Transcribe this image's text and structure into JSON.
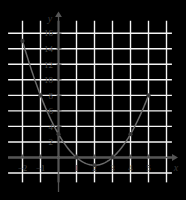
{
  "chart_data": {
    "type": "scatter",
    "title": "",
    "xlabel": "x",
    "ylabel": "y",
    "x": [
      -2,
      -1,
      0,
      1,
      2,
      3,
      4,
      5
    ],
    "values": [
      15,
      8,
      3,
      0,
      -1,
      0,
      3,
      8
    ],
    "series": [
      {
        "name": "y = x^2 - 4x + 3",
        "points": [
          {
            "x": -2,
            "y": 15
          },
          {
            "x": -1,
            "y": 8
          },
          {
            "x": 0,
            "y": 3
          },
          {
            "x": 1,
            "y": 0
          },
          {
            "x": 2,
            "y": -1
          },
          {
            "x": 3,
            "y": 0
          },
          {
            "x": 4,
            "y": 3
          },
          {
            "x": 5,
            "y": 8
          }
        ]
      }
    ],
    "xlim": [
      -2.8,
      6.3
    ],
    "ylim": [
      -3.2,
      17.6
    ],
    "xticks": [
      -2,
      -1,
      1,
      2,
      3,
      4,
      5
    ],
    "xtick_labels": [
      "−2",
      "−1",
      "1",
      "2",
      "3",
      "4",
      "5"
    ],
    "yticks": [
      2,
      4,
      6,
      8,
      10,
      12,
      14,
      16
    ],
    "ytick_labels": [
      "2",
      "4",
      "6",
      "8",
      "10",
      "12",
      "14",
      "16"
    ],
    "grid": true,
    "legend": "none",
    "curve_color": "#6b6b6b",
    "marker_color": "#3c3c3c",
    "axis_color": "#555555",
    "grid_color": "#f4f4f4",
    "background": "#ffffff",
    "annotations": []
  },
  "axes": {
    "x_label": "x",
    "y_label": "y"
  }
}
